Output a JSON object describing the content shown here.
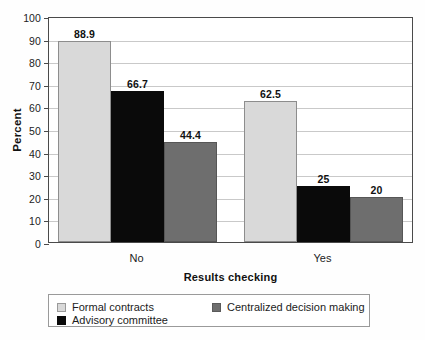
{
  "chart_data": {
    "type": "bar",
    "title": "",
    "xlabel": "Results checking",
    "ylabel": "Percent",
    "categories": [
      "No",
      "Yes"
    ],
    "series": [
      {
        "name": "Formal contracts",
        "color": "#d9d9d9",
        "values": [
          88.9,
          62.5
        ],
        "labels": [
          "88.9",
          "62.5"
        ]
      },
      {
        "name": "Advisory committee",
        "color": "#0a0a0a",
        "values": [
          66.7,
          25
        ],
        "labels": [
          "66.7",
          "25"
        ]
      },
      {
        "name": "Centralized decision making",
        "color": "#6e6e6e",
        "values": [
          44.4,
          20
        ],
        "labels": [
          "44.4",
          "20"
        ]
      }
    ],
    "ylim": [
      0,
      100
    ],
    "ytick_step": 10,
    "ytick_labels": [
      "0",
      "10",
      "20",
      "30",
      "40",
      "50",
      "60",
      "70",
      "80",
      "90",
      "100"
    ],
    "grid": true,
    "legend_position": "bottom"
  },
  "legend": {
    "entries": [
      {
        "label": "Formal contracts"
      },
      {
        "label": "Centralized decision making"
      },
      {
        "label": "Advisory committee"
      }
    ]
  }
}
